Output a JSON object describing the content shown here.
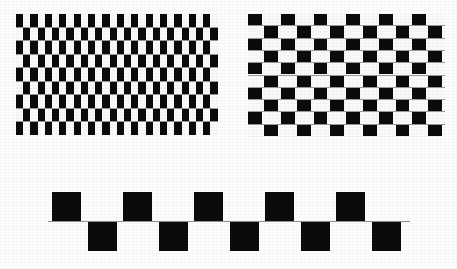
{
  "figure": {
    "background_color": "#fdfdfd",
    "tile_dark_color": "#0b0b0b",
    "tile_light_color": "#fafafa",
    "mortar_color": "#9a9a9a",
    "baseline_color": "#8f8f8f",
    "width": 457,
    "height": 269
  },
  "panels": [
    {
      "id": "left-checker-panel",
      "label": "Left tiled panel",
      "x": 16,
      "y": 14,
      "width": 202,
      "height": 122,
      "columns": 14,
      "rows": 9,
      "tile_width": 14.4,
      "row_height": 13.5,
      "mortar_thickness": 1,
      "duty_cycle": 0.5,
      "row_offsets_px": [
        0,
        -7.2,
        0,
        -7.2,
        0,
        -7.2,
        0,
        -7.2,
        0
      ],
      "description": "Equal width black and white tiles, alternating rows shifted by half a tile"
    },
    {
      "id": "right-checker-panel",
      "label": "Right tiled panel",
      "x": 248,
      "y": 14,
      "width": 197,
      "height": 123,
      "columns": 6,
      "rows": 10,
      "tile_width": 32.8,
      "row_height": 12.3,
      "mortar_thickness": 1,
      "duty_cycle": 0.42,
      "row_offsets_px": [
        0,
        -16.4,
        0,
        -16.4,
        0,
        -16.4,
        0,
        -16.4,
        0,
        -16.4
      ],
      "description": "Narrow white tiles on wide black ground, alternating rows shifted by half a period"
    }
  ],
  "bottom_figure": {
    "id": "twisted-cord-row",
    "label": "Single row demonstration",
    "baseline": {
      "x": 48,
      "y": 221,
      "width": 362,
      "height": 1
    },
    "square_size": 29,
    "squares_above": [
      {
        "x": 52,
        "y": 192
      },
      {
        "x": 123,
        "y": 192
      },
      {
        "x": 194,
        "y": 192
      },
      {
        "x": 265,
        "y": 192
      },
      {
        "x": 336,
        "y": 192
      }
    ],
    "squares_below": [
      {
        "x": 88,
        "y": 222
      },
      {
        "x": 159,
        "y": 222
      },
      {
        "x": 230,
        "y": 222
      },
      {
        "x": 301,
        "y": 222
      },
      {
        "x": 372,
        "y": 222
      }
    ],
    "description": "Five black squares above and five below a thin horizontal line, offset by half a period"
  }
}
